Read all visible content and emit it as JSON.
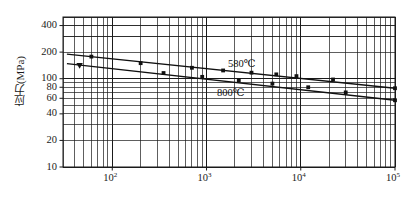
{
  "chart_data": {
    "type": "line",
    "title": "",
    "xlabel": "",
    "ylabel": "应力(MPa)",
    "xscale": "log",
    "yscale": "log",
    "xlim": [
      30,
      100000
    ],
    "ylim": [
      10,
      500
    ],
    "grid": true,
    "grid_type": "log-minor",
    "legend_position": "inline-annotation",
    "x_tick_labels": [
      "10",
      "10",
      "10",
      "10"
    ],
    "x_tick_exponents": [
      "2",
      "3",
      "4",
      "5"
    ],
    "x_tick_values": [
      100,
      1000,
      10000,
      100000
    ],
    "y_tick_labels": [
      "400",
      "200",
      "100",
      "80",
      "60",
      "40",
      "20",
      "10"
    ],
    "y_tick_values": [
      400,
      200,
      100,
      80,
      60,
      40,
      20,
      10
    ],
    "series": [
      {
        "name": "580℃",
        "label": "580℃",
        "color": "#111111",
        "marker": "square",
        "x": [
          60,
          200,
          700,
          1500,
          3000,
          5500,
          9000,
          22000,
          100000
        ],
        "y": [
          178,
          150,
          133,
          124,
          117,
          112,
          107,
          98,
          78
        ],
        "fit_endpoints": {
          "x": [
            33,
            100000
          ],
          "y": [
            190,
            78
          ]
        }
      },
      {
        "name": "800℃",
        "label": "800℃",
        "color": "#111111",
        "marker": "triangle-down",
        "x": [
          45,
          350,
          900,
          2200,
          5000,
          12000,
          30000,
          100000
        ],
        "y": [
          141,
          116,
          105,
          96,
          88,
          80,
          70,
          57
        ],
        "fit_endpoints": {
          "x": [
            33,
            100000
          ],
          "y": [
            148,
            57
          ]
        }
      }
    ],
    "annotations": [
      {
        "text": "580℃",
        "x_px": 228,
        "y_px": 57
      },
      {
        "text": "800℃",
        "x_px": 217,
        "y_px": 86
      }
    ]
  },
  "axis": {
    "y_title": "应力(MPa)"
  }
}
